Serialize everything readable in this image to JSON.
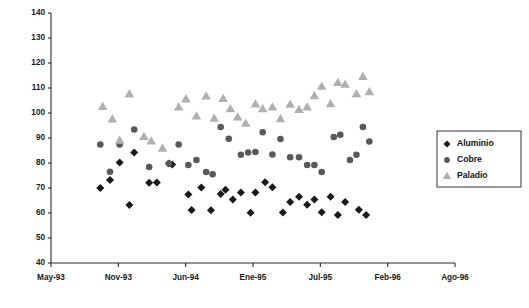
{
  "chart_data": {
    "type": "scatter",
    "title": "",
    "xlabel": "",
    "ylabel": "",
    "ylim": [
      40,
      140
    ],
    "ytick_values": [
      40,
      50,
      60,
      70,
      80,
      90,
      100,
      110,
      120,
      130,
      140
    ],
    "xtick_labels": [
      "May-93",
      "Nov-93",
      "Jun-94",
      "Ene-95",
      "Jul-95",
      "Feb-96",
      "Ago-96"
    ],
    "grid": false,
    "legend_position": "right",
    "series": [
      {
        "name": "Aluminio",
        "marker": "diamond",
        "color": "#1a1a1a",
        "points": [
          [
            0.122,
            70.0
          ],
          [
            0.146,
            73.2
          ],
          [
            0.17,
            80.2
          ],
          [
            0.194,
            63.2
          ],
          [
            0.206,
            84.2
          ],
          [
            0.243,
            72.1
          ],
          [
            0.262,
            72.2
          ],
          [
            0.292,
            79.8
          ],
          [
            0.3,
            79.4
          ],
          [
            0.34,
            67.4
          ],
          [
            0.348,
            61.2
          ],
          [
            0.372,
            70.2
          ],
          [
            0.396,
            61.1
          ],
          [
            0.42,
            67.6
          ],
          [
            0.432,
            69.3
          ],
          [
            0.45,
            65.4
          ],
          [
            0.47,
            68.2
          ],
          [
            0.494,
            60.1
          ],
          [
            0.506,
            68.2
          ],
          [
            0.53,
            72.3
          ],
          [
            0.548,
            70.3
          ],
          [
            0.574,
            60.2
          ],
          [
            0.592,
            64.4
          ],
          [
            0.614,
            66.5
          ],
          [
            0.634,
            63.3
          ],
          [
            0.652,
            65.4
          ],
          [
            0.67,
            60.3
          ],
          [
            0.692,
            66.5
          ],
          [
            0.71,
            59.2
          ],
          [
            0.728,
            64.4
          ],
          [
            0.762,
            61.3
          ],
          [
            0.78,
            59.2
          ]
        ]
      },
      {
        "name": "Cobre",
        "marker": "circle",
        "color": "#595959",
        "points": [
          [
            0.122,
            87.4
          ],
          [
            0.146,
            76.5
          ],
          [
            0.17,
            87.4
          ],
          [
            0.206,
            93.4
          ],
          [
            0.243,
            78.4
          ],
          [
            0.292,
            79.8
          ],
          [
            0.316,
            87.4
          ],
          [
            0.34,
            79.2
          ],
          [
            0.36,
            81.2
          ],
          [
            0.384,
            76.4
          ],
          [
            0.4,
            75.5
          ],
          [
            0.42,
            94.4
          ],
          [
            0.44,
            89.7
          ],
          [
            0.47,
            83.3
          ],
          [
            0.488,
            84.2
          ],
          [
            0.506,
            84.4
          ],
          [
            0.524,
            92.3
          ],
          [
            0.548,
            83.4
          ],
          [
            0.568,
            89.6
          ],
          [
            0.592,
            82.3
          ],
          [
            0.614,
            82.3
          ],
          [
            0.634,
            79.2
          ],
          [
            0.652,
            79.2
          ],
          [
            0.67,
            76.4
          ],
          [
            0.7,
            90.4
          ],
          [
            0.716,
            91.3
          ],
          [
            0.74,
            81.2
          ],
          [
            0.756,
            83.3
          ],
          [
            0.772,
            94.4
          ],
          [
            0.788,
            88.6
          ]
        ]
      },
      {
        "name": "Paladio",
        "marker": "triangle",
        "color": "#b0b0b0",
        "points": [
          [
            0.128,
            102.6
          ],
          [
            0.152,
            97.6
          ],
          [
            0.17,
            89.1
          ],
          [
            0.194,
            107.6
          ],
          [
            0.23,
            90.6
          ],
          [
            0.248,
            88.8
          ],
          [
            0.276,
            85.9
          ],
          [
            0.316,
            102.4
          ],
          [
            0.334,
            105.6
          ],
          [
            0.36,
            98.8
          ],
          [
            0.384,
            106.8
          ],
          [
            0.404,
            97.9
          ],
          [
            0.426,
            105.8
          ],
          [
            0.444,
            101.7
          ],
          [
            0.462,
            98.4
          ],
          [
            0.482,
            95.9
          ],
          [
            0.506,
            103.6
          ],
          [
            0.524,
            101.7
          ],
          [
            0.548,
            102.4
          ],
          [
            0.568,
            97.7
          ],
          [
            0.592,
            103.5
          ],
          [
            0.614,
            101.4
          ],
          [
            0.634,
            102.4
          ],
          [
            0.652,
            106.9
          ],
          [
            0.67,
            110.7
          ],
          [
            0.692,
            103.7
          ],
          [
            0.71,
            112.2
          ],
          [
            0.728,
            111.5
          ],
          [
            0.756,
            107.7
          ],
          [
            0.772,
            114.6
          ],
          [
            0.788,
            108.5
          ]
        ]
      }
    ]
  },
  "legend": {
    "items": [
      {
        "label": "Aluminio",
        "marker": "diamond",
        "color": "#1a1a1a"
      },
      {
        "label": "Cobre",
        "marker": "circle",
        "color": "#595959"
      },
      {
        "label": "Paladio",
        "marker": "triangle",
        "color": "#b0b0b0"
      }
    ]
  }
}
